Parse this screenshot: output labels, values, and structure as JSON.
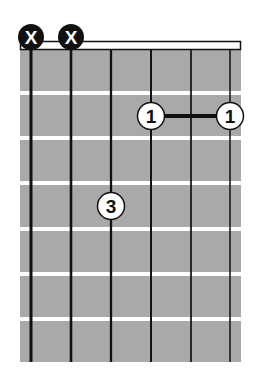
{
  "diagram": {
    "type": "guitar-chord-chart",
    "colors": {
      "fretboard": "#a9a9a9",
      "fret": "#ffffff",
      "string": "#111111",
      "nut_fill": "#ffffff",
      "nut_border": "#111111",
      "mute_fill": "#111111",
      "mute_text": "#ffffff",
      "finger_fill": "#ffffff",
      "finger_border": "#111111",
      "finger_text": "#111111"
    },
    "strings": 6,
    "frets_shown": 7,
    "muted_strings": [
      {
        "string": 1,
        "symbol": "X"
      },
      {
        "string": 2,
        "symbol": "X"
      }
    ],
    "fingers": [
      {
        "string": 3,
        "fret": 4,
        "label": "3"
      },
      {
        "string": 4,
        "fret": 2,
        "label": "1"
      },
      {
        "string": 6,
        "fret": 2,
        "label": "1"
      }
    ],
    "barre": {
      "from_string": 4,
      "to_string": 6,
      "fret": 2
    }
  }
}
